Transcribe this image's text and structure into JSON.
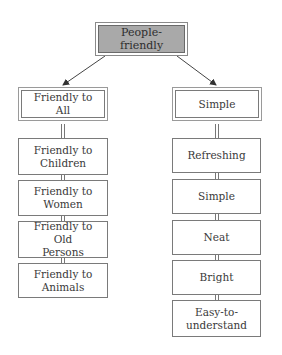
{
  "diagram": {
    "type": "hierarchy",
    "root": {
      "label": "People-friendly",
      "fill_color": "#a9a9a9"
    },
    "branches": [
      {
        "label": "Friendly to All",
        "children": [
          {
            "label": "Friendly to\nChildren"
          },
          {
            "label": "Friendly to\nWomen"
          },
          {
            "label": "Friendly to Old\nPersons"
          },
          {
            "label": "Friendly to\nAnimals"
          }
        ]
      },
      {
        "label": "Simple",
        "children": [
          {
            "label": "Refreshing"
          },
          {
            "label": "Simple"
          },
          {
            "label": "Neat"
          },
          {
            "label": "Bright"
          },
          {
            "label": "Easy-to-\nunderstand"
          }
        ]
      }
    ],
    "line_color": "#555555",
    "border_color": "#7a7a7a"
  }
}
